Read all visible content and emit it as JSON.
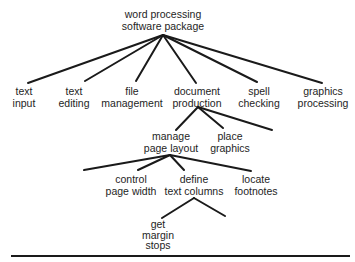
{
  "diagram": {
    "type": "tree",
    "root": {
      "id": "root",
      "lines": [
        "word processing",
        "software package"
      ]
    },
    "level1": [
      {
        "id": "text-input",
        "lines": [
          "text",
          "input"
        ]
      },
      {
        "id": "text-editing",
        "lines": [
          "text",
          "editing"
        ]
      },
      {
        "id": "file-management",
        "lines": [
          "file",
          "management"
        ]
      },
      {
        "id": "document-production",
        "lines": [
          "document",
          "production"
        ]
      },
      {
        "id": "spell-checking",
        "lines": [
          "spell",
          "checking"
        ]
      },
      {
        "id": "graphics-processing",
        "lines": [
          "graphics",
          "processing"
        ]
      }
    ],
    "document_production_children": [
      {
        "id": "manage-page-layout",
        "lines": [
          "manage",
          "page layout"
        ]
      },
      {
        "id": "place-graphics",
        "lines": [
          "place",
          "graphics"
        ]
      },
      {
        "id": "unlabeled-branch-1",
        "lines": []
      }
    ],
    "manage_page_layout_children": [
      {
        "id": "unlabeled-branch-2",
        "lines": []
      },
      {
        "id": "control-page-width",
        "lines": [
          "control",
          "page width"
        ]
      },
      {
        "id": "define-text-columns",
        "lines": [
          "define",
          "text columns"
        ]
      },
      {
        "id": "locate-footnotes",
        "lines": [
          "locate",
          "footnotes"
        ]
      }
    ],
    "define_text_columns_children": [
      {
        "id": "get-margin-stops",
        "lines": [
          "get",
          "margin",
          "stops"
        ]
      },
      {
        "id": "unlabeled-branch-3",
        "lines": []
      }
    ]
  }
}
